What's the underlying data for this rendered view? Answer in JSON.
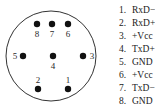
{
  "connector": {
    "outline_color": "#333333",
    "pin_color": "#111111",
    "pins": [
      {
        "number": "1",
        "x": 68,
        "y": 89,
        "label_x": 68,
        "label_y": 80
      },
      {
        "number": "2",
        "x": 38,
        "y": 89,
        "label_x": 38,
        "label_y": 80
      },
      {
        "number": "3",
        "x": 83,
        "y": 56,
        "label_x": 92,
        "label_y": 56
      },
      {
        "number": "4",
        "x": 53,
        "y": 56,
        "label_x": 53,
        "label_y": 66
      },
      {
        "number": "5",
        "x": 23,
        "y": 56,
        "label_x": 15,
        "label_y": 56
      },
      {
        "number": "6",
        "x": 68,
        "y": 24,
        "label_x": 68,
        "label_y": 34
      },
      {
        "number": "7",
        "x": 52,
        "y": 24,
        "label_x": 52,
        "label_y": 34
      },
      {
        "number": "8",
        "x": 37,
        "y": 24,
        "label_x": 37,
        "label_y": 34
      }
    ]
  },
  "pinout": [
    {
      "number": "1.",
      "signal": "RxD−"
    },
    {
      "number": "2.",
      "signal": "RxD+"
    },
    {
      "number": "3.",
      "signal": "+Vcc"
    },
    {
      "number": "4.",
      "signal": "TxD+"
    },
    {
      "number": "5.",
      "signal": "GND"
    },
    {
      "number": "6.",
      "signal": "+Vcc"
    },
    {
      "number": "7.",
      "signal": "TxD−"
    },
    {
      "number": "8.",
      "signal": "GND"
    }
  ]
}
